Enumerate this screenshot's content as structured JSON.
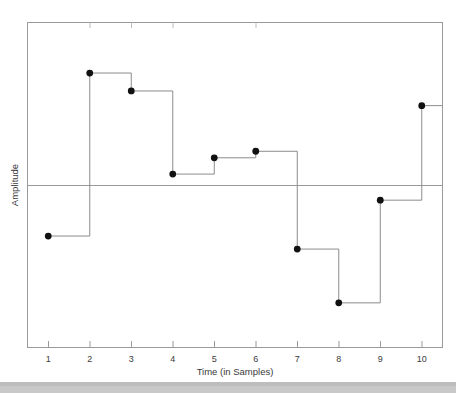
{
  "chart_data": {
    "type": "line",
    "subtype": "step-discrete-samples",
    "title": "",
    "xlabel": "Time (in Samples)",
    "ylabel": "Amplitude",
    "x": [
      1,
      2,
      3,
      4,
      5,
      6,
      7,
      8,
      9,
      10
    ],
    "xtick_labels": [
      "1",
      "2",
      "3",
      "4",
      "5",
      "6",
      "7",
      "8",
      "9",
      "10"
    ],
    "values": [
      -0.31,
      0.69,
      0.58,
      0.07,
      0.17,
      0.21,
      -0.39,
      -0.72,
      -0.09,
      0.49
    ],
    "ytick_labels": [],
    "xlim": [
      0.5,
      10.5
    ],
    "ylim": [
      -1.0,
      1.0
    ],
    "zero_line": 0,
    "grid": false,
    "legend": null,
    "marker": "filled-circle",
    "marker_color": "#111111",
    "line_color": "#8c8c8c",
    "axis_color": "#8c8c8c",
    "background": "#ffffff"
  },
  "figure": {
    "x_axis_label": "Time (in Samples)",
    "y_axis_label": "Amplitude"
  }
}
